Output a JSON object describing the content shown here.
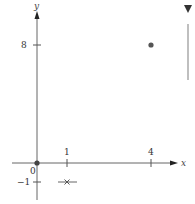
{
  "diagram": {
    "axes": {
      "x_label": "x",
      "y_label": "y",
      "origin_label": "0"
    },
    "ticks": {
      "x": [
        {
          "value": 1,
          "label": "1"
        },
        {
          "value": 4,
          "label": "4"
        }
      ],
      "y": [
        {
          "value": 8,
          "label": "8"
        },
        {
          "value": -1,
          "label": "−1"
        }
      ]
    },
    "points": [
      {
        "x": 0,
        "y": 0,
        "marker": "filled-circle"
      },
      {
        "x": 4,
        "y": 8,
        "marker": "filled-circle"
      },
      {
        "x": 1,
        "y": -1,
        "marker": "cross"
      }
    ],
    "colors": {
      "axis": "#555555",
      "point": "#555555"
    }
  },
  "side_panel": {
    "collapse_icon": "triangle-down-icon"
  }
}
